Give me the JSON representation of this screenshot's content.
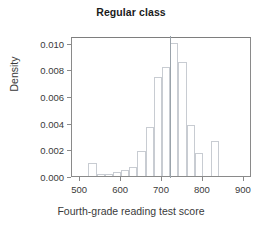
{
  "chart_data": {
    "type": "bar",
    "title": "Regular class",
    "xlabel": "Fourth-grade reading test score",
    "ylabel": "Density",
    "subtitle": "",
    "grid": false,
    "legend": null,
    "xlim": [
      480,
      920
    ],
    "ylim": [
      0.0,
      0.0105
    ],
    "xticks": [
      500,
      600,
      700,
      800,
      900
    ],
    "xtick_labels": [
      "500",
      "600",
      "700",
      "800",
      "900"
    ],
    "yticks": [
      0.0,
      0.002,
      0.004,
      0.006,
      0.008,
      0.01
    ],
    "ytick_labels": [
      "0.000",
      "0.002",
      "0.004",
      "0.006",
      "0.008",
      "0.010"
    ],
    "bin_width": 20,
    "bin_starts": [
      500,
      520,
      540,
      560,
      580,
      600,
      620,
      640,
      660,
      680,
      700,
      720,
      740,
      760,
      780,
      800,
      820,
      840,
      860,
      880
    ],
    "categories": [
      "500-520",
      "520-540",
      "540-560",
      "560-580",
      "580-600",
      "600-620",
      "620-640",
      "640-660",
      "660-680",
      "680-700",
      "700-720",
      "720-740",
      "740-760",
      "760-780",
      "780-800",
      "800-820",
      "820-840",
      "840-860",
      "860-880",
      "880-900"
    ],
    "values": [
      0.0,
      0.00095,
      0.00012,
      0.00018,
      0.00032,
      0.00048,
      0.00065,
      0.00188,
      0.00368,
      0.00745,
      0.00815,
      0.00995,
      0.00852,
      0.00385,
      0.00175,
      0.0,
      0.00265,
      0.0,
      0.0,
      0.0
    ],
    "annotations": [
      {
        "name": "reference-line",
        "type": "vline",
        "x": 720,
        "color": "#9aa3ab"
      }
    ],
    "colors": {
      "bar_edge": "#c8ccd2",
      "bar_fill": "transparent",
      "axis": "#8a8a8a",
      "title_text": "#1b1b1b",
      "label_text": "#3a3a3a",
      "background": "#ffffff"
    }
  }
}
